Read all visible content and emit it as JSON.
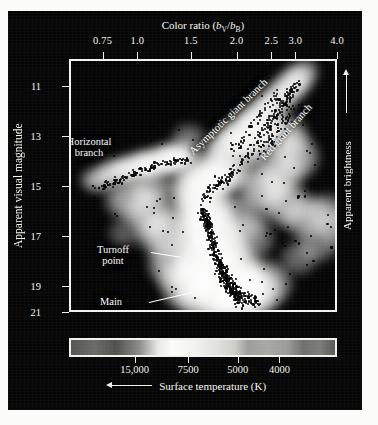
{
  "figure": {
    "kind": "color-magnitude-diagram",
    "background_color": "#060606",
    "frame_color": "#f2f2ee",
    "star_color": "#000000"
  },
  "axes": {
    "top": {
      "title_prefix": "Color ratio (",
      "title_num": "b",
      "title_num_sub": "V",
      "title_slash": "/",
      "title_den": "b",
      "title_den_sub": "B",
      "title_suffix": ")",
      "title_plain": "Color ratio (bV/bB)",
      "ticks": [
        "0.75",
        "1.0",
        "1.5",
        "2.0",
        "2.5",
        "3.0",
        "4.0"
      ],
      "tick_values": [
        0.75,
        1.0,
        1.5,
        2.0,
        2.5,
        3.0,
        4.0
      ],
      "tick_fracs": [
        0.125,
        0.255,
        0.455,
        0.625,
        0.755,
        0.845,
        1.0
      ]
    },
    "left": {
      "title": "Apparent visual magnitude",
      "ticks": [
        "11",
        "13",
        "15",
        "17",
        "19",
        "21"
      ],
      "tick_values": [
        11,
        13,
        15,
        17,
        19,
        21
      ],
      "tick_fracs": [
        0.108,
        0.305,
        0.502,
        0.699,
        0.896,
        1.0
      ]
    },
    "right": {
      "title": "Apparent brightness",
      "arrow": "up-arrow-icon"
    },
    "bottom": {
      "title": "Surface temperature (K)",
      "arrow": "left-arrow-icon",
      "ticks": [
        "15,000",
        "7500",
        "5000",
        "4000"
      ],
      "tick_values": [
        15000,
        7500,
        5000,
        4000
      ],
      "tick_fracs": [
        0.245,
        0.445,
        0.63,
        0.785
      ]
    }
  },
  "annotations": [
    {
      "id": "horizontal-branch",
      "lines": [
        "Horizontal",
        "branch"
      ],
      "x": 18,
      "y": 75,
      "align": "center",
      "style": "dark",
      "rotate": 0
    },
    {
      "id": "asymptotic-giant-branch",
      "lines": [
        "Asymptotic giant branch"
      ],
      "x": 120,
      "y": 86,
      "align": "left",
      "style": "dark",
      "rotate": -44
    },
    {
      "id": "red-giant-branch",
      "lines": [
        "Red giant branch"
      ],
      "x": 191,
      "y": 92,
      "align": "left",
      "style": "onwhite",
      "rotate": -48
    },
    {
      "id": "turnoff-point",
      "lines": [
        "Turnoff",
        "point"
      ],
      "x": 42,
      "y": 183,
      "align": "center",
      "style": "dark",
      "rotate": 0
    },
    {
      "id": "main-sequence",
      "lines": [
        "Main",
        "sequence"
      ],
      "x": 40,
      "y": 235,
      "align": "center",
      "style": "dark",
      "rotate": 0
    }
  ],
  "leaders": [
    {
      "id": "turnoff-point-leader",
      "x": 80,
      "y": 191,
      "length": 30,
      "angle": 9
    },
    {
      "id": "main-sequence-leader",
      "x": 78,
      "y": 241,
      "length": 44,
      "angle": -13
    }
  ],
  "gradient_strip": {
    "name": "temperature-color-strip",
    "stops": [
      {
        "pos": 0,
        "color": "#555553"
      },
      {
        "pos": 9,
        "color": "#6a6a67"
      },
      {
        "pos": 17,
        "color": "#4f4f4d"
      },
      {
        "pos": 26,
        "color": "#8d8d89"
      },
      {
        "pos": 33,
        "color": "#e9e9e5"
      },
      {
        "pos": 38,
        "color": "#fbfbf8"
      },
      {
        "pos": 47,
        "color": "#f2f2ef"
      },
      {
        "pos": 55,
        "color": "#e2e2de"
      },
      {
        "pos": 62,
        "color": "#cfcfca"
      },
      {
        "pos": 67,
        "color": "#9d9d99"
      },
      {
        "pos": 74,
        "color": "#a8a8a4"
      },
      {
        "pos": 82,
        "color": "#9b9b97"
      },
      {
        "pos": 88,
        "color": "#6f6f6c"
      },
      {
        "pos": 94,
        "color": "#7c7c78"
      },
      {
        "pos": 100,
        "color": "#5a5a57"
      }
    ]
  },
  "chart_data": {
    "type": "scatter",
    "title": "",
    "xlabel": "Color ratio (bV/bB)",
    "ylabel": "Apparent visual magnitude",
    "xlabel_secondary": "Surface temperature (K)",
    "ylabel_secondary": "Apparent brightness",
    "xlim": [
      0.6,
      4.0
    ],
    "ylim": [
      10.0,
      21.5
    ],
    "y_inverted": true,
    "x_inverted_temperature": true,
    "grid": false,
    "legend": "none",
    "note": "Globular-cluster color-magnitude diagram: black points are individual stars over a white density glow.",
    "populations": [
      {
        "name": "Main sequence",
        "n_points": 330,
        "color_ratio_range": [
          1.35,
          1.95
        ],
        "magnitude_range": [
          18.0,
          21.1
        ]
      },
      {
        "name": "Turnoff point",
        "n_points": 60,
        "color_ratio_range": [
          1.3,
          1.55
        ],
        "magnitude_range": [
          17.7,
          18.6
        ]
      },
      {
        "name": "Subgiant branch",
        "n_points": 70,
        "color_ratio_range": [
          1.45,
          1.85
        ],
        "magnitude_range": [
          16.2,
          17.9
        ]
      },
      {
        "name": "Red giant branch",
        "n_points": 150,
        "color_ratio_range": [
          1.8,
          3.1
        ],
        "magnitude_range": [
          11.2,
          16.4
        ]
      },
      {
        "name": "Asymptotic giant branch",
        "n_points": 55,
        "color_ratio_range": [
          1.85,
          2.8
        ],
        "magnitude_range": [
          11.6,
          14.6
        ]
      },
      {
        "name": "Horizontal branch",
        "n_points": 95,
        "color_ratio_range": [
          0.78,
          1.55
        ],
        "magnitude_range": [
          14.3,
          15.3
        ]
      }
    ]
  }
}
